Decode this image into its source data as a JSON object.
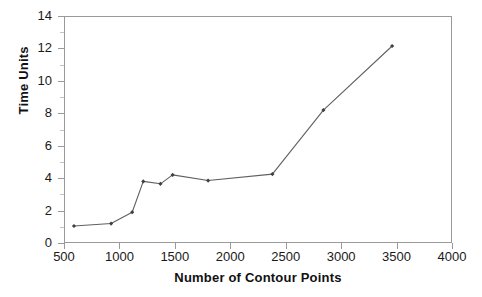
{
  "chart_data": {
    "type": "line",
    "title": "",
    "subtitle": "",
    "xlabel": "Number of Contour Points",
    "ylabel": "Time Units",
    "xlim": [
      500,
      4000
    ],
    "ylim": [
      0,
      14
    ],
    "xticks": [
      500,
      1000,
      1500,
      2000,
      2500,
      3000,
      3500,
      4000
    ],
    "xtick_labels": [
      "500",
      "1000",
      "1500",
      "2000",
      "2500",
      "3000",
      "3500",
      "4000"
    ],
    "yticks": [
      0,
      2,
      4,
      6,
      8,
      10,
      12,
      14
    ],
    "ytick_labels": [
      "0",
      "2",
      "4",
      "6",
      "8",
      "10",
      "12",
      "14"
    ],
    "grid": false,
    "legend": false,
    "legend_position": "none",
    "marker": "diamond",
    "marker_color": "#404040",
    "line_color": "#606060",
    "frame_color": "#9a9a9a",
    "series": [
      {
        "name": "Time Units",
        "x": [
          590,
          925,
          1115,
          1215,
          1370,
          1480,
          1800,
          2380,
          2840,
          3460
        ],
        "values": [
          1.05,
          1.2,
          1.9,
          3.8,
          3.65,
          4.2,
          3.85,
          4.25,
          8.2,
          12.15
        ]
      }
    ],
    "points": [
      {
        "x": 590,
        "y": 1.05
      },
      {
        "x": 925,
        "y": 1.2
      },
      {
        "x": 1115,
        "y": 1.9
      },
      {
        "x": 1215,
        "y": 3.8
      },
      {
        "x": 1370,
        "y": 3.65
      },
      {
        "x": 1480,
        "y": 4.2
      },
      {
        "x": 1800,
        "y": 3.85
      },
      {
        "x": 2380,
        "y": 4.25
      },
      {
        "x": 2840,
        "y": 8.2
      },
      {
        "x": 3460,
        "y": 12.15
      }
    ],
    "annotations": []
  }
}
